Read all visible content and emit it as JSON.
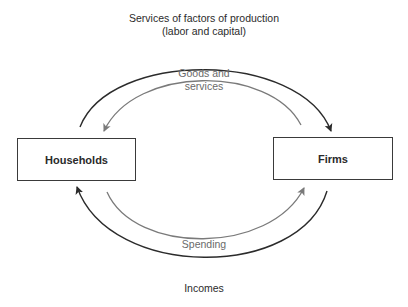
{
  "diagram": {
    "nodes": {
      "households": {
        "label": "Households"
      },
      "firms": {
        "label": "Firms"
      }
    },
    "flows": {
      "factor_services": {
        "line1": "Services of factors of production",
        "line2": "(labor and capital)",
        "from": "Households",
        "to": "Firms",
        "color": "#2b2b2b"
      },
      "goods_services": {
        "line1": "Goods and",
        "line2": "services",
        "from": "Firms",
        "to": "Households",
        "color": "#7a7a7a"
      },
      "spending": {
        "label": "Spending",
        "from": "Households",
        "to": "Firms",
        "color": "#7a7a7a"
      },
      "incomes": {
        "label": "Incomes",
        "from": "Firms",
        "to": "Households",
        "color": "#2b2b2b"
      }
    }
  }
}
